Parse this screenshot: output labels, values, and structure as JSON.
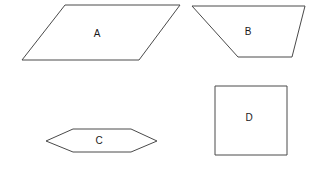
{
  "figure": {
    "background_color": "#ffffff",
    "stroke_color": "#4a4a4a",
    "label_color": "#1a1a1a",
    "width": 318,
    "height": 169
  },
  "shapes": [
    {
      "id": "shape-a",
      "label": "A",
      "kind": "parallelogram",
      "points": "65,5 180,5 139,60 22,60",
      "label_x": 97,
      "label_y": 34
    },
    {
      "id": "shape-b",
      "label": "B",
      "kind": "trapezoid",
      "points": "192,6 305,6 292,57 238,57",
      "label_x": 248,
      "label_y": 32
    },
    {
      "id": "shape-c",
      "label": "C",
      "kind": "hexagon",
      "points": "73,129 131,129 157,141 131,152 73,152 46,141",
      "label_x": 99,
      "label_y": 141
    },
    {
      "id": "shape-d",
      "label": "D",
      "kind": "square",
      "points": "215,86 287,86 287,155 215,155",
      "label_x": 249,
      "label_y": 118
    }
  ]
}
